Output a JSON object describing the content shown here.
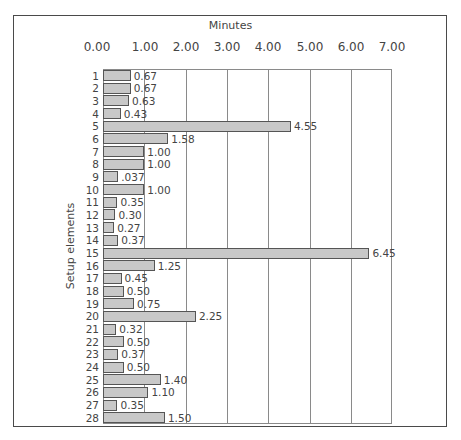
{
  "chart_data": {
    "type": "bar",
    "orientation": "horizontal",
    "title": "",
    "xlabel": "Minutes",
    "ylabel": "Setup elements",
    "xlim": [
      0,
      7
    ],
    "x_ticks": [
      "0.00",
      "1.00",
      "2.00",
      "3.00",
      "4.00",
      "5.00",
      "6.00",
      "7.00"
    ],
    "grid": "vertical",
    "legend": "none",
    "categories": [
      "1",
      "2",
      "3",
      "4",
      "5",
      "6",
      "7",
      "8",
      "9",
      "10",
      "11",
      "12",
      "13",
      "14",
      "15",
      "16",
      "17",
      "18",
      "19",
      "20",
      "21",
      "22",
      "23",
      "24",
      "25",
      "26",
      "27",
      "28"
    ],
    "values": [
      0.67,
      0.67,
      0.63,
      0.43,
      4.55,
      1.58,
      1.0,
      1.0,
      0.37,
      1.0,
      0.35,
      0.3,
      0.27,
      0.37,
      6.45,
      1.25,
      0.45,
      0.5,
      0.75,
      2.25,
      0.32,
      0.5,
      0.37,
      0.5,
      1.4,
      1.1,
      0.35,
      1.5
    ],
    "value_labels": [
      "0.67",
      "0.67",
      "0.63",
      "0.43",
      "4.55",
      "1.58",
      "1.00",
      "1.00",
      ".037",
      "1.00",
      "0.35",
      "0.30",
      "0.27",
      "0.37",
      "6.45",
      "1.25",
      "0.45",
      "0.50",
      "0.75",
      "2.25",
      "0.32",
      "0.50",
      "0.37",
      "0.50",
      "1.40",
      "1.10",
      "0.35",
      "1.50"
    ],
    "bar_color": "#c8c8c8",
    "bar_edge_color": "#555555"
  }
}
